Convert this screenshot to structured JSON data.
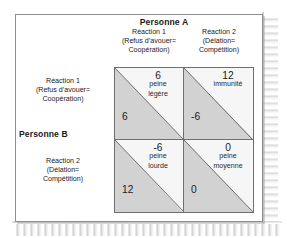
{
  "figure": {
    "type": "payoff-matrix",
    "title_column": "Personne A",
    "title_row": "Personne B",
    "columns": [
      {
        "id": "c1",
        "line1": "Réaction 1",
        "line2": "(Refus d’avouer=",
        "line3": "Coopération)"
      },
      {
        "id": "c2",
        "line1": "Réaction 2",
        "line2": "(Délation=",
        "line3": "Compétition)"
      }
    ],
    "rows": [
      {
        "id": "r1",
        "line1": "Réaction 1",
        "line2": "(Refus d’avouer=",
        "line3": "Coopération)"
      },
      {
        "id": "r2",
        "line1": "Réaction 2",
        "line2": "(Délation=",
        "line3": "Compétition)"
      }
    ],
    "cells": [
      {
        "id": "cell-coop-coop",
        "a_value": "6",
        "a_note_1": "peine",
        "a_note_2": "légère",
        "b_value": "6"
      },
      {
        "id": "cell-coop-defect",
        "a_value": "12",
        "a_note_1": "immunité",
        "a_note_2": "",
        "b_value": "-6"
      },
      {
        "id": "cell-defect-coop",
        "a_value": "-6",
        "a_note_1": "peine",
        "a_note_2": "lourde",
        "b_value": "12"
      },
      {
        "id": "cell-defect-defect",
        "a_value": "0",
        "a_note_1": "peine",
        "a_note_2": "moyenne",
        "b_value": "0"
      }
    ],
    "colors": {
      "frame_border": "#8d8d8d",
      "matrix_border": "#6f6f6f",
      "upper_triangle": "#f6f6f6",
      "lower_triangle": "#c9c9c9",
      "text": "#1a1a1a",
      "page_background": "#ffffff"
    }
  }
}
